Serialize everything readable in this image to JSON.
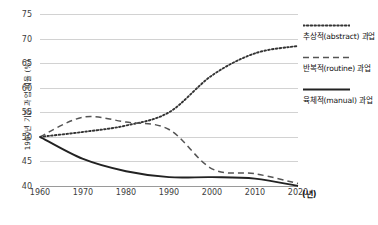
{
  "chart_data": {
    "type": "line",
    "title": "",
    "xlabel": "(년)",
    "ylabel": "1960년 기준 과업 비율 (%)",
    "xlim": [
      1960,
      2020
    ],
    "ylim": [
      40,
      75
    ],
    "yticks": [
      75,
      70,
      65,
      60,
      55,
      50,
      45,
      40
    ],
    "xticks": [
      1960,
      1970,
      1980,
      1990,
      2000,
      2010,
      2020
    ],
    "grid": true,
    "legend_position": "right",
    "x": [
      1960,
      1970,
      1980,
      1990,
      2000,
      2010,
      2020
    ],
    "series": [
      {
        "name": "추상적(abstract) 과업",
        "style": "dotted",
        "color": "#333333",
        "values": [
          50.0,
          51.0,
          52.3,
          55.0,
          62.5,
          67.0,
          68.5
        ]
      },
      {
        "name": "반복적(routine) 과업",
        "style": "dashed",
        "color": "#555555",
        "values": [
          50.0,
          54.0,
          53.0,
          51.5,
          43.5,
          42.5,
          40.5
        ]
      },
      {
        "name": "육체적(manual) 과업",
        "style": "solid",
        "color": "#222222",
        "values": [
          50.0,
          45.5,
          43.0,
          41.8,
          41.8,
          41.5,
          40.0
        ]
      }
    ]
  },
  "axes": {
    "y_title": "1960년 기준 과업 비율 (%)",
    "y_tick_labels": [
      "75",
      "70",
      "65",
      "60",
      "55",
      "50",
      "45",
      "40"
    ],
    "x_tick_labels": [
      "1960",
      "1970",
      "1980",
      "1990",
      "2000",
      "2010",
      "2020"
    ],
    "x_unit": "(년)"
  },
  "legend": {
    "items": [
      {
        "label": "추상적(abstract) 과업",
        "style": "dotted"
      },
      {
        "label": "반복적(routine) 과업",
        "style": "dashed"
      },
      {
        "label": "육체적(manual) 과업",
        "style": "solid"
      }
    ]
  }
}
